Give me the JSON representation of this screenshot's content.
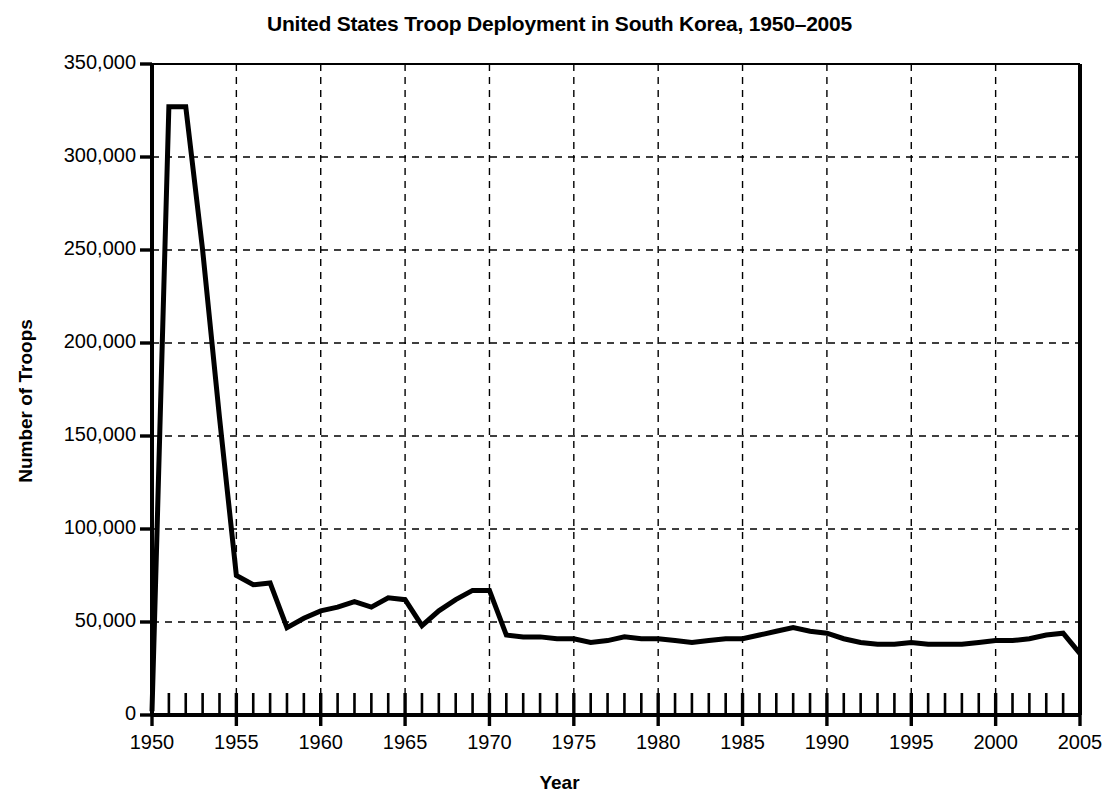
{
  "chart_data": {
    "type": "line",
    "title": "United States Troop Deployment in South Korea, 1950–2005",
    "xlabel": "Year",
    "ylabel": "Number of Troops",
    "xlim": [
      1950,
      2005
    ],
    "ylim": [
      0,
      350000
    ],
    "grid": true,
    "legend": "none",
    "y_ticks": [
      0,
      50000,
      100000,
      150000,
      200000,
      250000,
      300000,
      350000
    ],
    "y_tick_labels": [
      "0",
      "50,000",
      "100,000",
      "150,000",
      "200,000",
      "250,000",
      "300,000",
      "350,000"
    ],
    "x_ticks": [
      1950,
      1955,
      1960,
      1965,
      1970,
      1975,
      1980,
      1985,
      1990,
      1995,
      2000,
      2005
    ],
    "x_tick_labels": [
      "1950",
      "1955",
      "1960",
      "1965",
      "1970",
      "1975",
      "1980",
      "1985",
      "1990",
      "1995",
      "2000",
      "2005"
    ],
    "x_minor_tick_interval": 1,
    "line_color": "#000000",
    "line_width": 5,
    "x": [
      1950,
      1951,
      1952,
      1953,
      1954,
      1955,
      1956,
      1957,
      1958,
      1959,
      1960,
      1961,
      1962,
      1963,
      1964,
      1965,
      1966,
      1967,
      1968,
      1969,
      1970,
      1971,
      1972,
      1973,
      1974,
      1975,
      1976,
      1977,
      1978,
      1979,
      1980,
      1981,
      1982,
      1983,
      1984,
      1985,
      1986,
      1987,
      1988,
      1989,
      1990,
      1991,
      1992,
      1993,
      1994,
      1995,
      1996,
      1997,
      1998,
      1999,
      2000,
      2001,
      2002,
      2003,
      2004,
      2005
    ],
    "values": [
      2000,
      327000,
      327000,
      250000,
      160000,
      75000,
      70000,
      71000,
      47000,
      52000,
      56000,
      58000,
      61000,
      58000,
      63000,
      62000,
      48000,
      56000,
      62000,
      67000,
      67000,
      43000,
      42000,
      42000,
      41000,
      41000,
      39000,
      40000,
      42000,
      41000,
      41000,
      40000,
      39000,
      40000,
      41000,
      41000,
      43000,
      45000,
      47000,
      45000,
      44000,
      41000,
      39000,
      38000,
      38000,
      39000,
      38000,
      38000,
      38000,
      39000,
      40000,
      40000,
      41000,
      43000,
      44000,
      33000
    ]
  },
  "series_name": "US troops in South Korea"
}
